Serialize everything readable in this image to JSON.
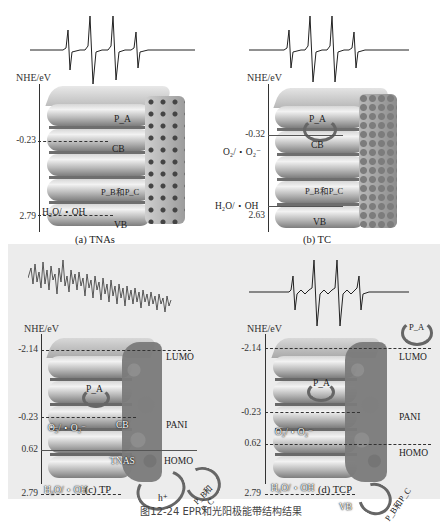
{
  "figure": {
    "caption": "图12-24 EPR和光阳极能带结构结果",
    "axis_title": "NHE/eV"
  },
  "panels": {
    "a": {
      "label": "(a) TNAs",
      "epr": "four-line hyperfine signal",
      "ticks": [
        "-0.23",
        "2.79"
      ],
      "bands": [
        "CB",
        "VB"
      ],
      "species": [
        "P_A",
        "P_B和P_C"
      ],
      "redox": [
        "H₂O/・OH"
      ]
    },
    "b": {
      "label": "(b) TC",
      "epr": "four-line hyperfine signal",
      "ticks": [
        "-0.32",
        "2.63"
      ],
      "bands": [
        "CB",
        "VB"
      ],
      "species": [
        "P_A",
        "P_B和P_C"
      ],
      "redox": [
        "O₂/・O₂⁻",
        "H₂O/・OH"
      ]
    },
    "c": {
      "label": "(c) TP",
      "epr": "noise (no signal)",
      "ticks": [
        "-2.14",
        "-0.23",
        "0.62",
        "2.79"
      ],
      "bands": [
        "LUMO",
        "CB",
        "PANI",
        "HOMO",
        "TNAS"
      ],
      "species": [
        "P_A",
        "h⁺",
        "P_B和P_C"
      ],
      "redox": [
        "O₂/・O₂⁻",
        "H₂O/・OH"
      ]
    },
    "d": {
      "label": "(d) TCP",
      "epr": "four-line hyperfine signal",
      "ticks": [
        "-2.14",
        "-0.23",
        "0.62",
        "2.79"
      ],
      "bands": [
        "LUMO",
        "PANI",
        "HOMO",
        "VB"
      ],
      "species": [
        "P_A",
        "P_A",
        "P_B和P_C"
      ],
      "redox": [
        "O₂/・O₂⁻",
        "H₂O/・OH"
      ]
    }
  }
}
